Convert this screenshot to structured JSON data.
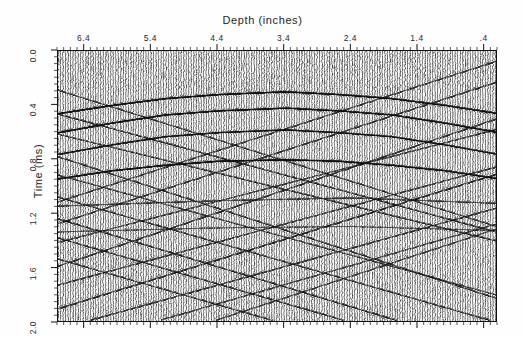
{
  "figure": {
    "width": 525,
    "height": 337,
    "background_color": "#ffffff",
    "ink_color": "#111111",
    "type": "seismic-wiggle-trace-section"
  },
  "axes": {
    "x": {
      "title": "Depth (inches)",
      "position": "top",
      "direction": "reversed",
      "range": [
        6.8,
        0.2
      ],
      "major_ticks": [
        6.4,
        5.4,
        4.4,
        3.4,
        2.4,
        1.4,
        0.4
      ],
      "major_tick_labels": [
        "6.4",
        "5.4",
        "4.4",
        "3.4",
        "2.4",
        "1.4",
        ".4"
      ],
      "minor_tick_interval": 0.1
    },
    "y": {
      "title": "Time (ms)",
      "position": "left",
      "direction": "increasing-downward",
      "range": [
        0.0,
        2.0
      ],
      "major_ticks": [
        0.0,
        0.4,
        0.8,
        1.2,
        1.6,
        2.0
      ],
      "major_tick_labels": [
        "0.0",
        "0.4",
        "0.8",
        "1.2",
        "1.6",
        "2.0"
      ],
      "minor_tick_interval": 0.05
    }
  },
  "chart_data": {
    "type": "line",
    "title": "Depth (inches)",
    "subtitle": "",
    "xlabel": "Depth (inches)",
    "ylabel": "Time (ms)",
    "xlim": [
      6.8,
      0.2
    ],
    "ylim": [
      2.0,
      0.0
    ],
    "grid": false,
    "legend": "none",
    "display_mode": "variable-area wiggle trace",
    "trace_count": 176,
    "traces_per_inch": 26,
    "samples_per_trace": 272,
    "fill_polarity": "positive peaks filled black",
    "annotations": [],
    "series": [
      {
        "name": "arched-reflector-1",
        "kind": "arched reflector",
        "apex_depth_in": 3.4,
        "apex_time_ms": 0.3,
        "edge_time_ms": 0.46,
        "amplitude": "strong",
        "x": [
          6.8,
          6.0,
          5.2,
          4.4,
          3.4,
          2.6,
          1.8,
          1.0,
          0.2
        ],
        "y": [
          0.46,
          0.4,
          0.35,
          0.32,
          0.3,
          0.32,
          0.35,
          0.4,
          0.46
        ]
      },
      {
        "name": "arched-reflector-2",
        "kind": "arched reflector",
        "apex_depth_in": 3.4,
        "apex_time_ms": 0.42,
        "edge_time_ms": 0.6,
        "amplitude": "strong",
        "x": [
          6.8,
          6.0,
          5.2,
          4.4,
          3.4,
          2.6,
          1.8,
          1.0,
          0.2
        ],
        "y": [
          0.6,
          0.53,
          0.47,
          0.44,
          0.42,
          0.44,
          0.47,
          0.53,
          0.6
        ]
      },
      {
        "name": "arched-reflector-3",
        "kind": "arched reflector",
        "apex_depth_in": 3.4,
        "apex_time_ms": 0.58,
        "edge_time_ms": 0.76,
        "amplitude": "moderate",
        "x": [
          6.8,
          6.0,
          5.2,
          4.4,
          3.4,
          2.6,
          1.8,
          1.0,
          0.2
        ],
        "y": [
          0.76,
          0.69,
          0.63,
          0.6,
          0.58,
          0.6,
          0.63,
          0.69,
          0.76
        ]
      },
      {
        "name": "arched-reflector-4",
        "kind": "arched reflector",
        "apex_depth_in": 3.4,
        "apex_time_ms": 0.8,
        "edge_time_ms": 0.94,
        "amplitude": "strong",
        "x": [
          6.8,
          6.0,
          5.2,
          4.4,
          3.4,
          2.6,
          1.8,
          1.0,
          0.2
        ],
        "y": [
          0.94,
          0.88,
          0.84,
          0.81,
          0.8,
          0.81,
          0.84,
          0.88,
          0.94
        ]
      },
      {
        "name": "near-flat-reflector-1",
        "kind": "sub-horizontal reflector",
        "apex_time_ms": 1.1,
        "amplitude": "moderate",
        "x": [
          6.8,
          4.4,
          2.4,
          0.2
        ],
        "y": [
          1.14,
          1.1,
          1.08,
          1.12
        ]
      },
      {
        "name": "near-flat-reflector-2",
        "kind": "sub-horizontal reflector",
        "apex_time_ms": 1.3,
        "amplitude": "weak",
        "x": [
          6.8,
          4.4,
          2.4,
          0.2
        ],
        "y": [
          1.33,
          1.3,
          1.29,
          1.32
        ]
      },
      {
        "name": "dipping-event-set-left",
        "kind": "cross-dipping diffraction limbs",
        "dip_sign": "down-to-the-right",
        "count": 9,
        "time_range_ms": [
          0.35,
          1.75
        ]
      },
      {
        "name": "dipping-event-set-right",
        "kind": "cross-dipping diffraction limbs",
        "dip_sign": "down-to-the-left",
        "count": 9,
        "time_range_ms": [
          0.35,
          1.75
        ]
      },
      {
        "name": "background-noise",
        "kind": "incoherent ringing / noise",
        "time_range_ms": [
          0.0,
          2.0
        ],
        "amplitude": "low"
      }
    ]
  }
}
